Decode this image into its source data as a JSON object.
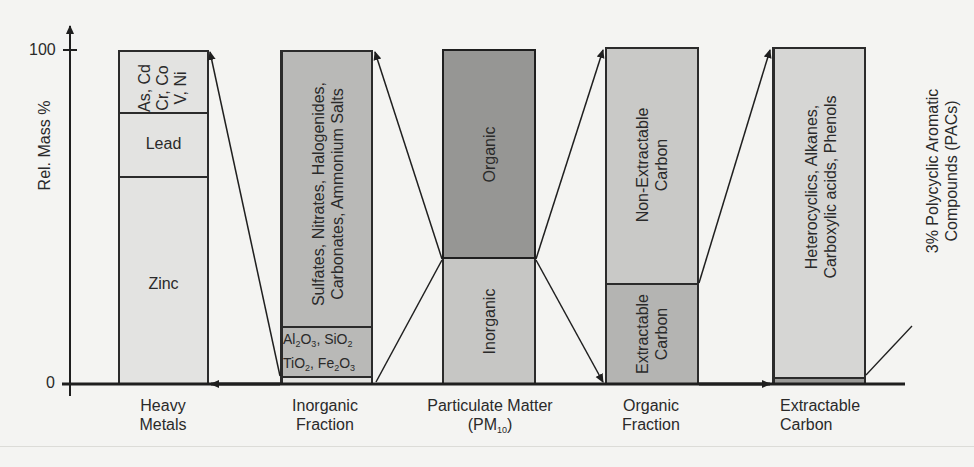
{
  "figure": {
    "y_axis": {
      "label": "Rel. Mass %",
      "ticks": [
        {
          "value": "100",
          "y": 50
        },
        {
          "value": "0",
          "y": 384
        }
      ]
    },
    "columns": [
      {
        "id": "heavy-metals",
        "label_line1": "Heavy",
        "label_line2": "Metals",
        "segments": [
          {
            "name": "trace-metals",
            "text_lines": [
              "As, Cd",
              "Cr, Co",
              "V, Ni"
            ],
            "color": "#e3e3e1"
          },
          {
            "name": "lead",
            "text": "Lead",
            "color": "#e3e3e1"
          },
          {
            "name": "zinc",
            "text": "Zinc",
            "color": "#e3e3e1"
          }
        ]
      },
      {
        "id": "inorganic-fraction",
        "label_line1": "Inorganic",
        "label_line2": "Fraction",
        "segments": [
          {
            "name": "salts",
            "text_lines": [
              "Sulfates, Nitrates, Halogenides,",
              "Carbonates, Ammonium Salts"
            ],
            "color": "#b9b9b7"
          },
          {
            "name": "oxides",
            "line1": "Al2O3, SiO2",
            "line2": "TiO2, Fe2O3",
            "color": "#b9b9b7"
          },
          {
            "name": "heavy-metals-band",
            "color": "#e3e3e1"
          }
        ]
      },
      {
        "id": "particulate-matter",
        "label_line1": "Particulate Matter",
        "label_line2": "(PM10)",
        "segments": [
          {
            "name": "organic",
            "text": "Organic",
            "color": "#969694"
          },
          {
            "name": "inorganic",
            "text": "Inorganic",
            "color": "#c6c6c4"
          }
        ]
      },
      {
        "id": "organic-fraction",
        "label_line1": "Organic",
        "label_line2": "Fraction",
        "segments": [
          {
            "name": "non-extractable-carbon",
            "text_lines": [
              "Non-Extractable",
              "Carbon"
            ],
            "color": "#c9c9c7"
          },
          {
            "name": "extractable-carbon",
            "text_lines": [
              "Extractable",
              "Carbon"
            ],
            "color": "#b4b4b2"
          }
        ]
      },
      {
        "id": "extractable-carbon",
        "label_line1": "Extractable",
        "label_line2": "Carbon",
        "segments": [
          {
            "name": "other-organics",
            "text_lines": [
              "Heterocyclics, Alkanes,",
              "Carboxylic acids, Phenols"
            ],
            "color": "#d6d6d4"
          },
          {
            "name": "pacs-band",
            "color": "#9a9a98"
          }
        ]
      }
    ],
    "annotation": {
      "text_lines": [
        "3% Polycyclic Aromatic",
        "Compounds (PACs)"
      ]
    }
  }
}
